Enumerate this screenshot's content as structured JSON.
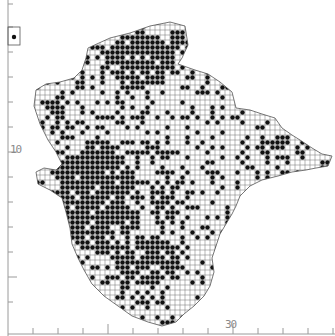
{
  "map": {
    "type": "dot-distribution-grid",
    "grid_cell_px": 5,
    "colors": {
      "background": "#ffffff",
      "grid": "#6e6e6e",
      "dot": "#111111",
      "axis": "#9a9a9a",
      "outline": "#555555"
    },
    "axis": {
      "y_label": "10",
      "x_label": "30",
      "y_ticks_px": [
        4,
        27,
        52,
        77,
        102,
        127,
        152,
        177,
        202,
        227,
        252,
        277,
        302
      ],
      "y_major_ticks_px": [
        152,
        277
      ],
      "x_ticks_px": [
        33,
        58,
        83,
        108,
        133,
        158,
        183,
        208,
        233,
        258,
        283,
        308,
        333
      ],
      "x_major_ticks_px": [
        108,
        233
      ]
    },
    "inset": {
      "x": 8,
      "y": 27,
      "w": 12,
      "h": 18
    },
    "outline": [
      [
        88,
        48
      ],
      [
        110,
        38
      ],
      [
        130,
        33
      ],
      [
        150,
        26
      ],
      [
        170,
        22
      ],
      [
        185,
        26
      ],
      [
        188,
        45
      ],
      [
        182,
        58
      ],
      [
        178,
        64
      ],
      [
        195,
        70
      ],
      [
        208,
        74
      ],
      [
        220,
        82
      ],
      [
        232,
        92
      ],
      [
        236,
        108
      ],
      [
        250,
        110
      ],
      [
        262,
        114
      ],
      [
        275,
        118
      ],
      [
        282,
        128
      ],
      [
        292,
        135
      ],
      [
        300,
        140
      ],
      [
        312,
        148
      ],
      [
        322,
        154
      ],
      [
        332,
        156
      ],
      [
        328,
        166
      ],
      [
        316,
        168
      ],
      [
        306,
        170
      ],
      [
        292,
        172
      ],
      [
        278,
        176
      ],
      [
        262,
        180
      ],
      [
        250,
        186
      ],
      [
        240,
        196
      ],
      [
        236,
        206
      ],
      [
        232,
        214
      ],
      [
        226,
        224
      ],
      [
        220,
        234
      ],
      [
        216,
        246
      ],
      [
        212,
        258
      ],
      [
        214,
        272
      ],
      [
        210,
        286
      ],
      [
        204,
        296
      ],
      [
        194,
        306
      ],
      [
        184,
        314
      ],
      [
        176,
        322
      ],
      [
        162,
        326
      ],
      [
        148,
        322
      ],
      [
        132,
        316
      ],
      [
        118,
        306
      ],
      [
        104,
        296
      ],
      [
        92,
        284
      ],
      [
        84,
        270
      ],
      [
        78,
        258
      ],
      [
        72,
        244
      ],
      [
        70,
        228
      ],
      [
        66,
        212
      ],
      [
        62,
        198
      ],
      [
        50,
        190
      ],
      [
        38,
        184
      ],
      [
        36,
        172
      ],
      [
        44,
        168
      ],
      [
        56,
        170
      ],
      [
        62,
        164
      ],
      [
        56,
        152
      ],
      [
        48,
        140
      ],
      [
        40,
        124
      ],
      [
        34,
        106
      ],
      [
        36,
        90
      ],
      [
        46,
        84
      ],
      [
        60,
        82
      ],
      [
        74,
        78
      ],
      [
        82,
        70
      ],
      [
        86,
        58
      ]
    ],
    "dense_regions": [
      {
        "cx": 140,
        "cy": 60,
        "rx": 35,
        "ry": 28,
        "p": 0.85
      },
      {
        "cx": 175,
        "cy": 40,
        "rx": 12,
        "ry": 12,
        "p": 0.8
      },
      {
        "cx": 100,
        "cy": 200,
        "rx": 40,
        "ry": 55,
        "p": 0.9
      },
      {
        "cx": 80,
        "cy": 170,
        "rx": 28,
        "ry": 15,
        "p": 0.85
      },
      {
        "cx": 150,
        "cy": 260,
        "rx": 35,
        "ry": 25,
        "p": 0.75
      },
      {
        "cx": 130,
        "cy": 150,
        "rx": 50,
        "ry": 12,
        "p": 0.6
      },
      {
        "cx": 170,
        "cy": 200,
        "rx": 20,
        "ry": 40,
        "p": 0.55
      },
      {
        "cx": 60,
        "cy": 110,
        "rx": 25,
        "ry": 22,
        "p": 0.45
      },
      {
        "cx": 265,
        "cy": 150,
        "rx": 45,
        "ry": 15,
        "p": 0.35
      }
    ],
    "base_density": 0.22
  }
}
